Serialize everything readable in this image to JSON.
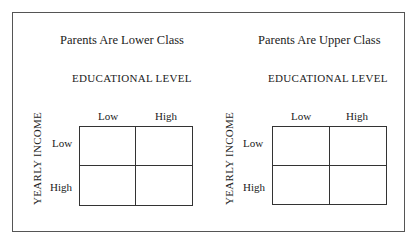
{
  "panels": [
    {
      "title": "Parents Are Lower Class",
      "column_axis": "EDUCATIONAL LEVEL",
      "row_axis": "YEARLY INCOME",
      "columns": [
        "Low",
        "High"
      ],
      "rows": [
        "Low",
        "High"
      ]
    },
    {
      "title": "Parents Are Upper Class",
      "column_axis": "EDUCATIONAL LEVEL",
      "row_axis": "YEARLY INCOME",
      "columns": [
        "Low",
        "High"
      ],
      "rows": [
        "Low",
        "High"
      ]
    }
  ]
}
